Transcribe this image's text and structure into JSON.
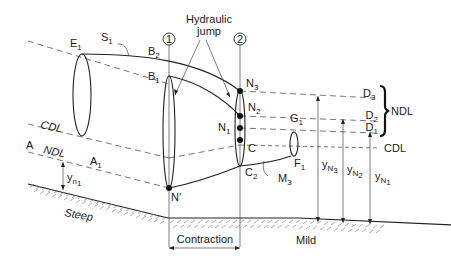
{
  "diagram": {
    "labels": {
      "E1": "E",
      "E1_sub": "1",
      "S1": "S",
      "S1_sub": "1",
      "B2": "B",
      "B2_sub": "2",
      "B1": "B",
      "B1_sub": "1",
      "hydraulic_jump_line1": "Hydraulic",
      "hydraulic_jump_line2": "jump",
      "section1": "1",
      "section2": "2",
      "N3": "N",
      "N3_sub": "3",
      "N2": "N",
      "N2_sub": "2",
      "N1": "N",
      "N1_sub": "1",
      "Nprime": "N′",
      "C": "C",
      "C2": "C",
      "C2_sub": "2",
      "G1": "G",
      "G1_sub": "1",
      "F1": "F",
      "F1_sub": "1",
      "M3": "M",
      "M3_sub": "3",
      "D3": "D",
      "D3_sub": "3",
      "D2": "D",
      "D2_sub": "2",
      "D1": "D",
      "D1_sub": "1",
      "NDL_right": "NDL",
      "CDL_left": "CDL",
      "CDL_right": "CDL",
      "A": "A",
      "NDL_left": "NDL",
      "A1": "A",
      "A1_sub": "1",
      "yn1": "y",
      "yn1_sub": "n",
      "yn1_subsub": "1",
      "yN3": "y",
      "yN3_sub": "N",
      "yN3_subsub": "3",
      "yN2": "y",
      "yN2_sub": "N",
      "yN2_subsub": "2",
      "yN1": "y",
      "yN1_sub": "N",
      "yN1_subsub": "1",
      "steep": "Steep",
      "mild": "Mild",
      "contraction": "Contraction"
    }
  }
}
